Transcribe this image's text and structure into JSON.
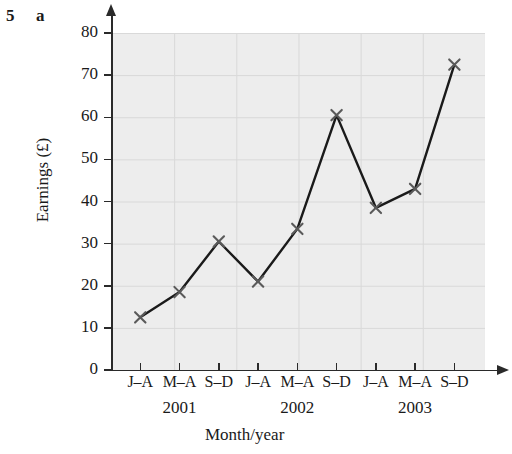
{
  "question": {
    "number": "5",
    "part": "a"
  },
  "chart_data": {
    "type": "line",
    "title": "",
    "xlabel": "Month/year",
    "ylabel": "Earnings (£)",
    "ylim": [
      0,
      80
    ],
    "ytick_step": 10,
    "yticks": [
      "0",
      "10",
      "20",
      "30",
      "40",
      "50",
      "60",
      "70",
      "80"
    ],
    "grid": true,
    "legend": "none",
    "marker": "x",
    "line_color": "#1a1a1a",
    "marker_color": "#5a5a5a",
    "grid_color": "#d8d8d8",
    "categories": [
      "J–A",
      "M–A",
      "S–D",
      "J–A",
      "M–A",
      "S–D",
      "J–A",
      "M–A",
      "S–D"
    ],
    "groups": [
      "2001",
      "2002",
      "2003"
    ],
    "values": [
      12.5,
      18.5,
      30.5,
      21.0,
      33.5,
      60.5,
      38.5,
      43.0,
      72.5
    ],
    "points": [
      {
        "category": "J–A",
        "year": "2001",
        "value": 12.5
      },
      {
        "category": "M–A",
        "year": "2001",
        "value": 18.5
      },
      {
        "category": "S–D",
        "year": "2001",
        "value": 30.5
      },
      {
        "category": "J–A",
        "year": "2002",
        "value": 21.0
      },
      {
        "category": "M–A",
        "year": "2002",
        "value": 33.5
      },
      {
        "category": "S–D",
        "year": "2002",
        "value": 60.5
      },
      {
        "category": "J–A",
        "year": "2003",
        "value": 38.5
      },
      {
        "category": "M–A",
        "year": "2003",
        "value": 43.0
      },
      {
        "category": "S–D",
        "year": "2003",
        "value": 72.5
      }
    ]
  }
}
